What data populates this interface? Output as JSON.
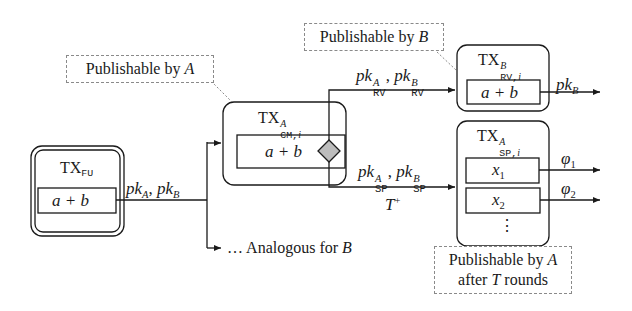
{
  "diagram": {
    "notes": {
      "publishable_a": {
        "text": "Publishable by ",
        "party": "A"
      },
      "publishable_b": {
        "text": "Publishable by ",
        "party": "B"
      },
      "publishable_a_after": {
        "line1": "Publishable by ",
        "party": "A",
        "line2_pre": "after ",
        "T": "T",
        "line2_post": " rounds"
      }
    },
    "nodes": {
      "tx_fu": {
        "title": "TX",
        "subscript": "FU",
        "output": "a + b"
      },
      "tx_cm": {
        "title": "TX",
        "superscript": "A",
        "subscript": "CM,",
        "sub_i": "i",
        "output": "a + b"
      },
      "tx_rv": {
        "title": "TX",
        "superscript": "B",
        "subscript": "RV,",
        "sub_i": "i",
        "output": "a + b"
      },
      "tx_sp": {
        "title": "TX",
        "superscript": "A",
        "subscript": "SP,",
        "sub_i": "i",
        "outputs": [
          "x",
          "x"
        ],
        "output_subs": [
          "1",
          "2"
        ],
        "ellipsis": "⋮"
      }
    },
    "edges": {
      "fu_out": {
        "pk": "pk",
        "sub1": "A",
        "sep": ", ",
        "sub2": "B"
      },
      "rv_in": {
        "pk": "pk",
        "sup1": "A",
        "sub1": "RV",
        "sep": ", ",
        "sup2": "B",
        "sub2": "RV"
      },
      "sp_in": {
        "pk": "pk",
        "sup1": "A",
        "sub1": "SP",
        "sep": ", ",
        "sup2": "B",
        "sub2": "SP",
        "timelock": "T",
        "timelock_sup": "+"
      },
      "rv_out": {
        "pk": "pk",
        "sub": "B"
      },
      "sp_out1": {
        "phi": "φ",
        "sub": "1"
      },
      "sp_out2": {
        "phi": "φ",
        "sub": "2"
      },
      "analogous": {
        "text": "… Analogous for ",
        "party": "B"
      }
    },
    "colors": {
      "line": "#1a1a1a",
      "note_border": "#8a8a8a",
      "diamond_fill": "#bdbdbd"
    }
  }
}
